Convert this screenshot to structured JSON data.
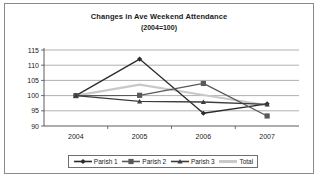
{
  "chart_data": {
    "type": "line",
    "title": "Changes in Ave Weekend Attendance",
    "subtitle": "(2004=100)",
    "xlabel": "",
    "ylabel": "",
    "categories": [
      "2004",
      "2005",
      "2006",
      "2007"
    ],
    "ylim": [
      90,
      115
    ],
    "yticks": [
      90,
      95,
      100,
      105,
      110,
      115
    ],
    "grid": true,
    "legend_position": "bottom",
    "series": [
      {
        "name": "Parish 1",
        "values": [
          100,
          112,
          94.2,
          97.3
        ],
        "marker": "diamond",
        "color": "#2b2b2b"
      },
      {
        "name": "Parish 2",
        "values": [
          100,
          100.1,
          104,
          93.3
        ],
        "marker": "square",
        "color": "#595959"
      },
      {
        "name": "Parish 3",
        "values": [
          100,
          98.1,
          97.9,
          97.1
        ],
        "marker": "triangle",
        "color": "#3d3d3d"
      },
      {
        "name": "Total",
        "values": [
          100,
          103.6,
          100.2,
          96.8
        ],
        "marker": "none",
        "color": "#c9c9c9"
      }
    ]
  },
  "legend": {
    "items": [
      {
        "label": "Parish 1"
      },
      {
        "label": "Parish 2"
      },
      {
        "label": "Parish 3"
      },
      {
        "label": "Total"
      }
    ]
  }
}
